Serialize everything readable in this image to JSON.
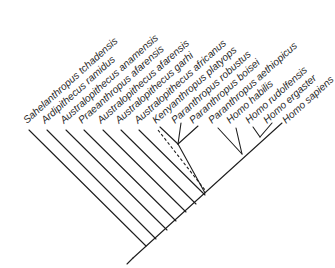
{
  "diagram": {
    "type": "cladogram",
    "title": "",
    "line_color": "#1e1e1e",
    "label_color": "#2a2a2a",
    "label_angle_deg": -42,
    "taxa": [
      {
        "label": "Sahelanthropus tchadensis",
        "tip": [
          29,
          129
        ],
        "base": [
          146,
          246
        ]
      },
      {
        "label": "Ardipithecus ramidus",
        "tip": [
          47,
          129
        ],
        "base": [
          160,
          238
        ]
      },
      {
        "label": "Australopithecus anamensis",
        "tip": [
          66,
          129
        ],
        "base": [
          172,
          231
        ]
      },
      {
        "label": "Praeanthropus afarensis",
        "tip": [
          84,
          129
        ],
        "base": [
          184,
          224
        ]
      },
      {
        "label": "Australopithecus afarensis",
        "tip": [
          103,
          129
        ],
        "base": [
          196,
          217
        ]
      },
      {
        "label": "Australopithecus garhi",
        "tip": [
          121,
          129
        ],
        "base": [
          206,
          211
        ]
      },
      {
        "label": "Australopithecus africanus",
        "tip": [
          121,
          129
        ],
        "base": [
          206,
          211
        ]
      },
      {
        "label": "Kenyanthropus platyops",
        "tip": [
          140,
          129
        ],
        "base": [
          205,
          193
        ],
        "dashed": true
      },
      {
        "label": "Paranthropus robustus",
        "tip": [
          158,
          129
        ],
        "base": [
          178,
          144
        ]
      },
      {
        "label": "Paranthropus boisei",
        "tip": [
          179,
          121
        ],
        "base": [
          178,
          144
        ]
      },
      {
        "label": "Paranthropus aethiopicus",
        "tip": [
          198,
          126
        ],
        "base": [
          178,
          144
        ]
      },
      {
        "label": "Homo habilis",
        "tip": [
          216,
          127
        ],
        "base": [
          242,
          154
        ]
      },
      {
        "label": "Homo rudolfensis",
        "tip": [
          234,
          127
        ],
        "base": [
          242,
          154
        ]
      },
      {
        "label": "Homo ergaster",
        "tip": [
          253,
          127
        ],
        "base": [
          262,
          137
        ]
      },
      {
        "label": "Homo sapiens",
        "tip": [
          272,
          127
        ],
        "base": [
          262,
          137
        ]
      }
    ],
    "labels": [
      "Sahelanthropus tchadensis",
      "Ardipithecus ramidus",
      "Australopithecus anamensis",
      "Praeanthropus afarensis",
      "Australopithecus afarensis",
      "Australopithecus garhi",
      "Australopithecus africanus",
      "Kenyanthropus platyops",
      "Paranthropus robustus",
      "Paranthropus boisei",
      "Paranthropus aethiopicus",
      "Homo habilis",
      "Homo rudolfensis",
      "Homo ergaster",
      "Homo sapiens"
    ]
  }
}
